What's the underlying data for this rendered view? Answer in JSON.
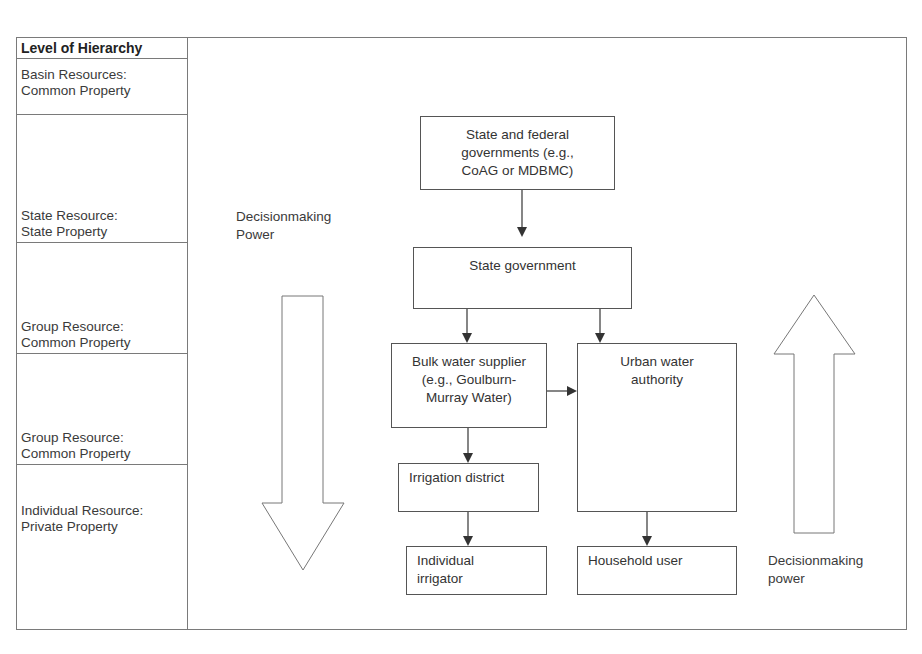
{
  "hierarchy": {
    "header": "Level of Hierarchy",
    "levels": [
      {
        "line1": "Basin Resources:",
        "line2": "Common Property"
      },
      {
        "line1": "State Resource:",
        "line2": "State Property"
      },
      {
        "line1": "Group Resource:",
        "line2": "Common Property"
      },
      {
        "line1": "Group Resource:",
        "line2": "Common Property"
      },
      {
        "line1": "Individual Resource:",
        "line2": "Private Property"
      }
    ]
  },
  "nodes": {
    "state_federal": {
      "line1": "State and federal",
      "line2": "governments (e.g.,",
      "line3": "CoAG or MDBMC)"
    },
    "state_government": {
      "line1": "State government"
    },
    "bulk_water": {
      "line1": "Bulk water supplier",
      "line2": "(e.g., Goulburn-",
      "line3": "Murray Water)"
    },
    "urban_water": {
      "line1": "Urban water",
      "line2": "authority"
    },
    "irrigation_district": {
      "line1": "Irrigation district"
    },
    "individual_irrigator": {
      "line1": "Individual",
      "line2": "irrigator"
    },
    "household_user": {
      "line1": "Household user"
    }
  },
  "arrows_labels": {
    "down": {
      "line1": "Decisionmaking",
      "line2": "Power"
    },
    "up": {
      "line1": "Decisionmaking",
      "line2": "power"
    }
  },
  "edges": [
    {
      "from": "state_federal",
      "to": "state_government"
    },
    {
      "from": "state_government",
      "to": "bulk_water"
    },
    {
      "from": "state_government",
      "to": "urban_water"
    },
    {
      "from": "bulk_water",
      "to": "urban_water"
    },
    {
      "from": "bulk_water",
      "to": "irrigation_district"
    },
    {
      "from": "irrigation_district",
      "to": "individual_irrigator"
    },
    {
      "from": "urban_water",
      "to": "household_user"
    }
  ],
  "colors": {
    "line": "#555555",
    "border": "#7a7a7a",
    "text": "#333333"
  }
}
